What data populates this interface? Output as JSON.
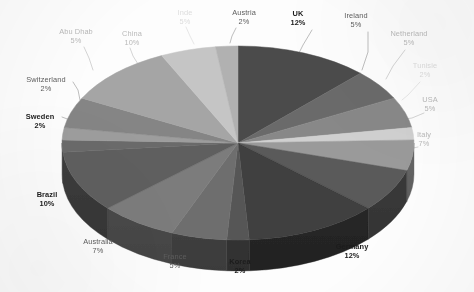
{
  "chart_data": {
    "type": "pie",
    "title": "",
    "subtitle": "",
    "xlabel": "",
    "ylabel": "",
    "legend_position": "none",
    "grid": false,
    "style": "3d-pie-grayscale",
    "value_suffix": "%",
    "start_angle_deg": 0,
    "direction": "clockwise",
    "categories": [
      "UK",
      "Ireland",
      "Netherland",
      "Tunisie",
      "USA",
      "Italy",
      "Germany",
      "Korea",
      "France",
      "Australia",
      "Brazil",
      "Sweden",
      "Switzerland",
      "Abu Dhab",
      "China",
      "Inde",
      "Austria"
    ],
    "values": [
      12,
      5,
      5,
      2,
      5,
      7,
      12,
      2,
      5,
      7,
      10,
      2,
      2,
      5,
      10,
      5,
      2
    ],
    "slices": [
      {
        "label": "UK",
        "value": 12,
        "pct_text": "12%",
        "color": "#4b4b4b",
        "side_color": "#323232",
        "emphasis": "bold",
        "label_x": 298,
        "label_y": 10,
        "label_align": "center",
        "leader": [
          [
            312,
            30
          ],
          [
            303,
            45
          ],
          [
            297,
            57
          ]
        ]
      },
      {
        "label": "Ireland",
        "value": 5,
        "pct_text": "5%",
        "color": "#6b6b6b",
        "side_color": "#474747",
        "emphasis": "mid",
        "label_x": 356,
        "label_y": 12,
        "label_align": "center",
        "leader": [
          [
            368,
            32
          ],
          [
            368,
            52
          ],
          [
            362,
            70
          ]
        ]
      },
      {
        "label": "Netherland",
        "value": 5,
        "pct_text": "5%",
        "color": "#888888",
        "side_color": "#5a5a5a",
        "emphasis": "faint",
        "label_x": 409,
        "label_y": 30,
        "label_align": "center",
        "leader": [
          [
            405,
            50
          ],
          [
            393,
            66
          ],
          [
            386,
            79
          ]
        ]
      },
      {
        "label": "Tunisie",
        "value": 2,
        "pct_text": "2%",
        "color": "#d0d0d0",
        "side_color": "#8c8c8c",
        "emphasis": "vfaint",
        "label_x": 425,
        "label_y": 62,
        "label_align": "center",
        "leader": [
          [
            420,
            82
          ],
          [
            408,
            95
          ],
          [
            402,
            100
          ]
        ]
      },
      {
        "label": "USA",
        "value": 5,
        "pct_text": "5%",
        "color": "#9a9a9a",
        "side_color": "#666666",
        "emphasis": "faint",
        "label_x": 430,
        "label_y": 96,
        "label_align": "center",
        "leader": [
          [
            424,
            113
          ],
          [
            412,
            118
          ],
          [
            405,
            119
          ]
        ]
      },
      {
        "label": "Italy",
        "value": 7,
        "pct_text": "7%",
        "color": "#5a5a5a",
        "side_color": "#3c3c3c",
        "emphasis": "faint",
        "label_x": 424,
        "label_y": 131,
        "label_align": "center",
        "leader": [
          [
            418,
            147
          ],
          [
            404,
            150
          ],
          [
            396,
            150
          ]
        ]
      },
      {
        "label": "Germany",
        "value": 12,
        "pct_text": "12%",
        "color": "#3f3f3f",
        "side_color": "#2a2a2a",
        "emphasis": "bold",
        "label_x": 352,
        "label_y": 243,
        "label_align": "center",
        "leader": [
          [
            330,
            243
          ],
          [
            324,
            237
          ],
          [
            320,
            230
          ]
        ]
      },
      {
        "label": "Korea",
        "value": 2,
        "pct_text": "2%",
        "color": "#575757",
        "side_color": "#393939",
        "emphasis": "bold",
        "label_x": 240,
        "label_y": 258,
        "label_align": "center",
        "leader": [
          [
            243,
            253
          ],
          [
            243,
            245
          ],
          [
            243,
            237
          ]
        ]
      },
      {
        "label": "France",
        "value": 5,
        "pct_text": "5%",
        "color": "#6e6e6e",
        "side_color": "#484848",
        "emphasis": "mid",
        "label_x": 175,
        "label_y": 253,
        "label_align": "center",
        "leader": [
          [
            192,
            251
          ],
          [
            198,
            243
          ],
          [
            203,
            235
          ]
        ]
      },
      {
        "label": "Australia",
        "value": 7,
        "pct_text": "7%",
        "color": "#7b7b7b",
        "side_color": "#515151",
        "emphasis": "mid",
        "label_x": 98,
        "label_y": 238,
        "label_align": "center",
        "leader": [
          [
            122,
            239
          ],
          [
            133,
            231
          ],
          [
            141,
            224
          ]
        ]
      },
      {
        "label": "Brazil",
        "value": 10,
        "pct_text": "10%",
        "color": "#5e5e5e",
        "side_color": "#3e3e3e",
        "emphasis": "bold",
        "label_x": 47,
        "label_y": 191,
        "label_align": "center",
        "leader": [
          [
            66,
            193
          ],
          [
            76,
            190
          ],
          [
            84,
            187
          ]
        ]
      },
      {
        "label": "Sweden",
        "value": 2,
        "pct_text": "2%",
        "color": "#6a6a6a",
        "side_color": "#454545",
        "emphasis": "bold",
        "label_x": 40,
        "label_y": 113,
        "label_align": "center",
        "leader": [
          [
            62,
            117
          ],
          [
            70,
            120
          ],
          [
            76,
            124
          ]
        ]
      },
      {
        "label": "Switzerland",
        "value": 2,
        "pct_text": "2%",
        "color": "#9d9d9d",
        "side_color": "#696969",
        "emphasis": "mid",
        "label_x": 46,
        "label_y": 76,
        "label_align": "center",
        "leader": [
          [
            73,
            82
          ],
          [
            78,
            90
          ],
          [
            80,
            100
          ]
        ]
      },
      {
        "label": "Abu Dhab",
        "value": 5,
        "pct_text": "5%",
        "color": "#858585",
        "side_color": "#585858",
        "emphasis": "faint",
        "label_x": 76,
        "label_y": 28,
        "label_align": "center",
        "leader": [
          [
            84,
            47
          ],
          [
            89,
            58
          ],
          [
            93,
            70
          ]
        ]
      },
      {
        "label": "China",
        "value": 10,
        "pct_text": "10%",
        "color": "#a5a5a5",
        "side_color": "#6e6e6e",
        "emphasis": "faint",
        "label_x": 132,
        "label_y": 30,
        "label_align": "center",
        "leader": [
          [
            130,
            48
          ],
          [
            133,
            56
          ],
          [
            138,
            64
          ]
        ]
      },
      {
        "label": "Inde",
        "value": 5,
        "pct_text": "5%",
        "color": "#c5c5c5",
        "side_color": "#848484",
        "emphasis": "vfaint",
        "label_x": 185,
        "label_y": 9,
        "label_align": "center",
        "leader": [
          [
            186,
            27
          ],
          [
            190,
            36
          ],
          [
            194,
            44
          ]
        ]
      },
      {
        "label": "Austria",
        "value": 2,
        "pct_text": "2%",
        "color": "#b1b1b1",
        "side_color": "#757575",
        "emphasis": "mid",
        "label_x": 244,
        "label_y": 9,
        "label_align": "center",
        "leader": [
          [
            236,
            28
          ],
          [
            232,
            36
          ],
          [
            230,
            43
          ]
        ]
      }
    ],
    "geometry": {
      "cx": 238,
      "cy": 143,
      "rx": 176,
      "ry": 97,
      "depth": 31
    },
    "colors": {
      "background": "#fdfdfd",
      "label_default": "#4a4a4a",
      "label_bold": "#1c1c1c",
      "leader_line": "#9e9e9e"
    }
  }
}
